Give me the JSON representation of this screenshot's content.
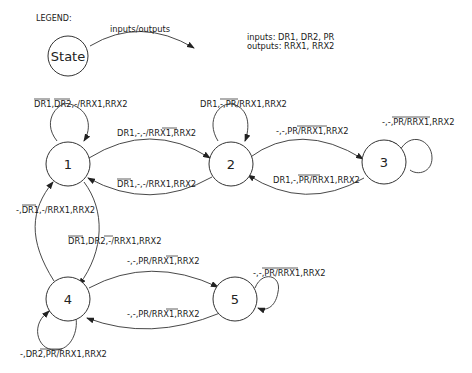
{
  "legend": {
    "title": "LEGEND:",
    "state_label": "State",
    "arrow_label": "inputs/outputs",
    "inputs_line": "inputs: DR1, DR2, PR",
    "outputs_line": "outputs: RRX1, RRX2"
  },
  "states": [
    {
      "id": "1",
      "label": "1"
    },
    {
      "id": "2",
      "label": "2"
    },
    {
      "id": "3",
      "label": "3"
    },
    {
      "id": "4",
      "label": "4"
    },
    {
      "id": "5",
      "label": "5"
    }
  ],
  "transitions": [
    {
      "from": "1",
      "to": "1",
      "label": "DR1,DR2,-/RRX1,RRX2",
      "overlines": [
        "DR1",
        "DR2"
      ]
    },
    {
      "from": "2",
      "to": "2",
      "label": "DR1,-,PR/RRX1,RRX2",
      "overlines": [
        "-,PR"
      ]
    },
    {
      "from": "3",
      "to": "3",
      "label": "-,-,PR/RRX1,RRX2",
      "overlines": [
        "-,PR/RRX1"
      ]
    },
    {
      "from": "1",
      "to": "2",
      "label": "DR1,-,-/RRX1,RRX2",
      "overlines": [
        "RRX1"
      ]
    },
    {
      "from": "2",
      "to": "1",
      "label": "DR1,-,-/RRX1,RRX2",
      "overlines": [
        "DR1"
      ]
    },
    {
      "from": "2",
      "to": "3",
      "label": "-,-,PR/RRX1,RRX2",
      "overlines": [
        "PR/RRX1"
      ]
    },
    {
      "from": "3",
      "to": "2",
      "label": "DR1,-,PR/RRX1,RRX2",
      "overlines": [
        "PR/RR"
      ]
    },
    {
      "from": "4",
      "to": "1",
      "label": "-,DR1,-/RRX1,RRX2",
      "overlines": [
        "DR1"
      ]
    },
    {
      "from": "1",
      "to": "4",
      "label": "DR1,DR2,-/RRX1,RRX2",
      "overlines": [
        "DR1",
        "-/"
      ]
    },
    {
      "from": "4",
      "to": "5",
      "label": "-,-,PR/RRX1,RRX2",
      "overlines": [
        "RRX1"
      ]
    },
    {
      "from": "5",
      "to": "4",
      "label": "-,-,PR/RRX1,RRX2",
      "overlines": [
        "RRX1"
      ]
    },
    {
      "from": "5",
      "to": "5",
      "label": "-,-,PR/RRX1,RRX2",
      "overlines": [
        "-,PR/RRX1"
      ]
    },
    {
      "from": "4",
      "to": "4",
      "label": "-,DR2,PR/RRX1,RRX2",
      "overlines": [
        "2,PR/"
      ]
    }
  ]
}
